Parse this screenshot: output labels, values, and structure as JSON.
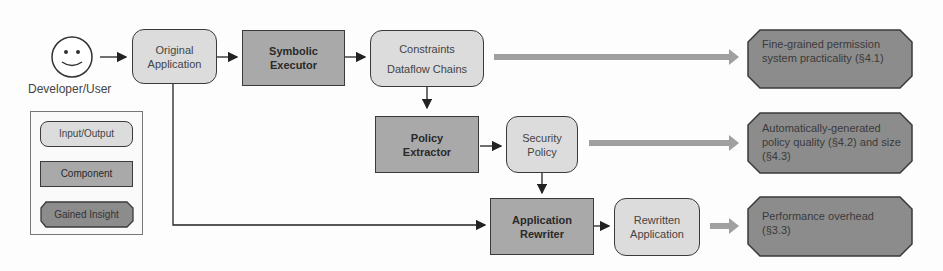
{
  "actor": {
    "label": "Developer/User",
    "icon": "smiley-face-icon"
  },
  "nodes": {
    "original_application": {
      "line1": "Original",
      "line2": "Application",
      "type": "Input/Output"
    },
    "symbolic_executor": {
      "line1": "Symbolic",
      "line2": "Executor",
      "type": "Component"
    },
    "constraints": {
      "line1": "Constraints",
      "line2": "Dataflow Chains",
      "type": "Input/Output"
    },
    "policy_extractor": {
      "line1": "Policy",
      "line2": "Extractor",
      "type": "Component"
    },
    "security_policy": {
      "line1": "Security",
      "line2": "Policy",
      "type": "Input/Output"
    },
    "application_rewriter": {
      "line1": "Application",
      "line2": "Rewriter",
      "type": "Component"
    },
    "rewritten_application": {
      "line1": "Rewritten",
      "line2": "Application",
      "type": "Input/Output"
    }
  },
  "insights": [
    {
      "text": "Fine-grained permission system practicality (§4.1)"
    },
    {
      "text": "Automatically-generated policy quality (§4.2) and size (§4.3)"
    },
    {
      "text": "Performance overhead (§3.3)"
    }
  ],
  "legend": {
    "items": [
      {
        "label": "Input/Output"
      },
      {
        "label": "Component"
      },
      {
        "label": "Gained Insight"
      }
    ]
  },
  "colors": {
    "io_fill": "#dcdcdc",
    "component_fill": "#a9a9a9",
    "insight_fill": "#8c8c8c",
    "wide_arrow": "#a0a0a0",
    "stroke": "#3a3a3a"
  }
}
